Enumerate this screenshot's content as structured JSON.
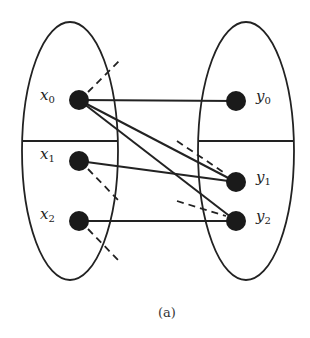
{
  "diagram": {
    "caption": "(a)",
    "left_set": {
      "nodes": [
        {
          "id": "x0",
          "label": "x",
          "sub": "0",
          "cx": 79,
          "cy": 100
        },
        {
          "id": "x1",
          "label": "x",
          "sub": "1",
          "cx": 79,
          "cy": 161
        },
        {
          "id": "x2",
          "label": "x",
          "sub": "2",
          "cx": 79,
          "cy": 221
        }
      ]
    },
    "right_set": {
      "nodes": [
        {
          "id": "y0",
          "label": "y",
          "sub": "0",
          "cx": 236,
          "cy": 101
        },
        {
          "id": "y1",
          "label": "y",
          "sub": "1",
          "cx": 236,
          "cy": 182
        },
        {
          "id": "y2",
          "label": "y",
          "sub": "2",
          "cx": 236,
          "cy": 221
        }
      ]
    },
    "edges": [
      {
        "from": "x0",
        "to": "y0",
        "style": "solid"
      },
      {
        "from": "x0",
        "to": "y1",
        "style": "solid"
      },
      {
        "from": "x0",
        "to": "y2",
        "style": "solid"
      },
      {
        "from": "x1",
        "to": "y1",
        "style": "solid"
      },
      {
        "from": "x2",
        "to": "y2",
        "style": "solid"
      }
    ],
    "dashed_stubs": [
      "x0",
      "x1",
      "x2",
      "y1",
      "y2"
    ]
  }
}
